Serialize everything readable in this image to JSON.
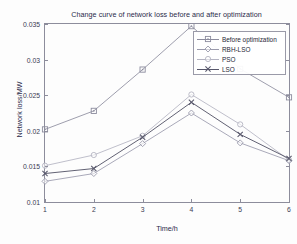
{
  "chart_data": {
    "type": "line",
    "title": "Change curve of network loss before and after optimization",
    "xlabel": "Time/h",
    "ylabel": "Network loss/MW",
    "x": [
      1,
      2,
      3,
      4,
      5,
      6
    ],
    "xlim": [
      1,
      6
    ],
    "ylim": [
      0.01,
      0.035
    ],
    "xticks": [
      "1",
      "2",
      "3",
      "4",
      "5",
      "6"
    ],
    "yticks": [
      "0.01",
      "0.015",
      "0.02",
      "0.025",
      "0.03",
      "0.035"
    ],
    "ytick_values": [
      0.01,
      0.015,
      0.02,
      0.025,
      0.03,
      0.035
    ],
    "grid": false,
    "legend_position": "upper right",
    "series": [
      {
        "name": "Before optimization",
        "marker": "square",
        "color": "#8c8c9e",
        "values": [
          0.0202,
          0.0228,
          0.0286,
          0.0347,
          0.0287,
          0.0247
        ]
      },
      {
        "name": "RBH-LSO",
        "marker": "diamond",
        "color": "#9a9aac",
        "values": [
          0.0129,
          0.014,
          0.0182,
          0.0225,
          0.0183,
          0.0158
        ]
      },
      {
        "name": "PSO",
        "marker": "circle",
        "color": "#b4b4c2",
        "values": [
          0.0151,
          0.0166,
          0.0193,
          0.0251,
          0.0209,
          0.0159
        ]
      },
      {
        "name": "LSO",
        "marker": "cross",
        "color": "#58586c",
        "values": [
          0.014,
          0.0147,
          0.0191,
          0.024,
          0.0195,
          0.0161
        ]
      }
    ]
  }
}
